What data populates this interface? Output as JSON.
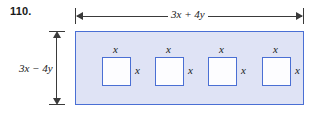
{
  "problem": {
    "number": "110."
  },
  "figure": {
    "shape": "rectangle-with-four-square-cutouts",
    "colors": {
      "rect_fill": "#dfe3f5",
      "rect_stroke": "#4a6fd4",
      "square_fill": "#fdfdff",
      "square_stroke": "#4a6fd4",
      "dimension_line": "#3a3a3a",
      "text": "#1a1a1a"
    },
    "dimensions": {
      "width_label": "3x + 4y",
      "height_label": "3x − 4y"
    },
    "squares": [
      {
        "top_label": "x",
        "right_label": "x"
      },
      {
        "top_label": "x",
        "right_label": "x"
      },
      {
        "top_label": "x",
        "right_label": "x"
      },
      {
        "top_label": "x",
        "right_label": "x"
      }
    ]
  }
}
